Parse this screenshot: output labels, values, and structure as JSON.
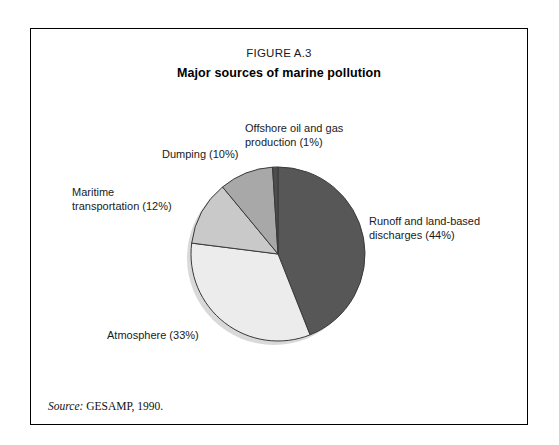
{
  "figure": {
    "number": "FIGURE A.3",
    "title": "Major sources of marine pollution",
    "source_label": "Source:",
    "source_text": " GESAMP, 1990."
  },
  "chart_data": {
    "type": "pie",
    "title": "Major sources of marine pollution",
    "xlabel": "",
    "ylabel": "",
    "start_angle_deg": 0,
    "direction": "clockwise",
    "legend_position": "callout-labels",
    "grid": false,
    "units": "percent",
    "categories": [
      "Runoff and land-based discharges",
      "Atmosphere",
      "Maritime transportation",
      "Dumping",
      "Offshore oil and gas production"
    ],
    "values": [
      44,
      33,
      12,
      10,
      1
    ],
    "colors": [
      "#575757",
      "#ececec",
      "#c9c9c9",
      "#a8a8a8",
      "#4d4d4d"
    ],
    "labels": [
      "Runoff and land-based\ndischarges (44%)",
      "Atmosphere (33%)",
      "Maritime\ntransportation (12%)",
      "Dumping (10%)",
      "Offshore oil and gas\nproduction (1%)"
    ]
  },
  "style": {
    "border_color": "#000000",
    "slice_stroke": "#3a3a3a",
    "shadow_color": "#d9d9d9",
    "background": "#ffffff"
  }
}
